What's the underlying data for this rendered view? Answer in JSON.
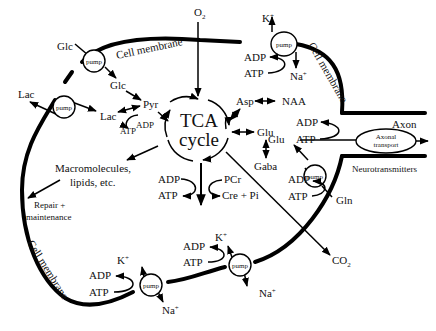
{
  "center": {
    "line1": "TCA",
    "line2": "cycle"
  },
  "membrane_labels": {
    "top_left": "Cell membrane",
    "top_right": "Cell membrane",
    "bottom_left": "Cell membrane"
  },
  "pump_label": "pump",
  "axonal_transport": {
    "line1": "Axonal",
    "line2": "transport"
  },
  "labels": {
    "o2": "O",
    "o2_sub": "2",
    "co2": "CO",
    "co2_sub": "2",
    "glc_out": "Glc",
    "glc_in": "Glc",
    "lac_out": "Lac",
    "lac_in": "Lac",
    "pyr": "Pyr",
    "atp_glyco": "ATP",
    "adp_glyco": "ADP",
    "asp": "Asp",
    "naa": "NAA",
    "glu_center": "Glu",
    "gaba": "Gaba",
    "glu_axon": "Glu",
    "axon": "Axon",
    "neurotransmitters": "Neurotransmitters",
    "gln": "Gln",
    "macro1": "Macromolecules,",
    "macro2": "lipids, etc.",
    "repair1": "Repair +",
    "repair2": "maintenance",
    "pcr": "PCr",
    "cre_pi": "Cre + Pi",
    "adp_center": "ADP",
    "atp_center": "ATP",
    "k_top": "K",
    "na_top": "Na",
    "adp_top": "ADP",
    "atp_top": "ATP",
    "adp_axon": "ADP",
    "atp_axon": "ATP",
    "adp_gln": "ADP",
    "atp_gln": "ATP",
    "k_bottom_left": "K",
    "na_bottom_left": "Na",
    "adp_bottom_left": "ADP",
    "atp_bottom_left": "ATP",
    "k_bottom_mid": "K",
    "na_bottom_mid": "Na",
    "adp_bottom_mid": "ADP",
    "atp_bottom_mid": "ATP",
    "plus": "+"
  }
}
